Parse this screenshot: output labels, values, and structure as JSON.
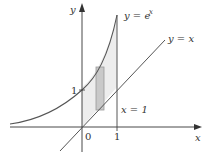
{
  "figure": {
    "axes": {
      "x_label": "x",
      "y_label": "y"
    },
    "ticks": {
      "origin": "0",
      "x_one": "1",
      "y_one": "1"
    },
    "curves": [
      {
        "name": "exponential",
        "label": "y = e",
        "superscript": "x"
      },
      {
        "name": "identity",
        "label": "y = x"
      }
    ],
    "vertical_line": {
      "label": "x = 1"
    },
    "colors": {
      "curve": "#555555",
      "axis": "#333333",
      "region_fill": "#ededed",
      "rect_fill": "#c9c9c9",
      "rect_stroke": "#999999"
    }
  }
}
